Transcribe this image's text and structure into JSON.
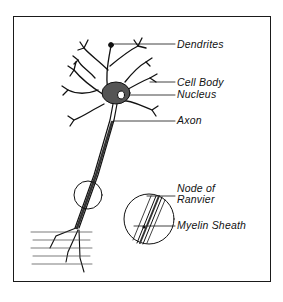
{
  "diagram": {
    "type": "labeled-anatomy-illustration",
    "labels": [
      {
        "id": "dendrites",
        "text": "Dendrites"
      },
      {
        "id": "cell_body",
        "text": "Cell Body"
      },
      {
        "id": "nucleus",
        "text": "Nucleus"
      },
      {
        "id": "axon",
        "text": "Axon"
      },
      {
        "id": "node_of_ranvier_line1",
        "text": "Node of"
      },
      {
        "id": "node_of_ranvier_line2",
        "text": "Ranvier"
      },
      {
        "id": "myelin_sheath",
        "text": "Myelin Sheath"
      }
    ],
    "inset": {
      "description": "magnified circle of axon segment"
    },
    "colors": {
      "ink": "#111111",
      "background": "#ffffff"
    }
  }
}
